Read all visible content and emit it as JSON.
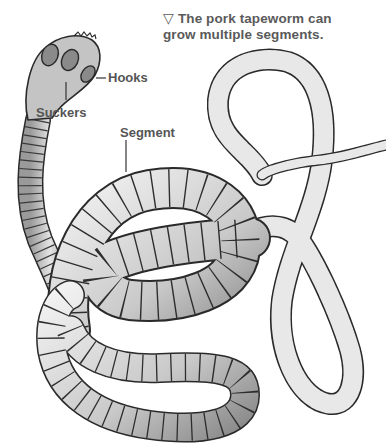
{
  "caption": {
    "marker": "▽",
    "line1": "The pork tapeworm can",
    "line2": "grow multiple segments."
  },
  "labels": {
    "hooks": "Hooks",
    "suckers": "Suckers",
    "segment": "Segment"
  },
  "illustration": {
    "subject": "pork tapeworm",
    "parts": [
      "scolex (head)",
      "hooks",
      "suckers",
      "neck",
      "segments (proglottids)"
    ]
  },
  "colors": {
    "text": "#5a5a5a",
    "outline": "#2a2a2a",
    "body_light": "#e6e6e6",
    "body_mid": "#b8b8b8",
    "body_dark": "#7a7a7a",
    "background": "#ffffff"
  }
}
